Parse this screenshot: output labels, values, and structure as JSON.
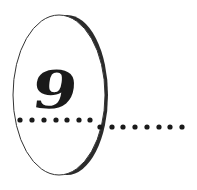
{
  "chapter": {
    "number": "9"
  },
  "colors": {
    "ink": "#1a1a1a",
    "rim": "#2b2b2b",
    "background": "#ffffff"
  },
  "dots": {
    "left_count": 7,
    "right_count": 8
  }
}
